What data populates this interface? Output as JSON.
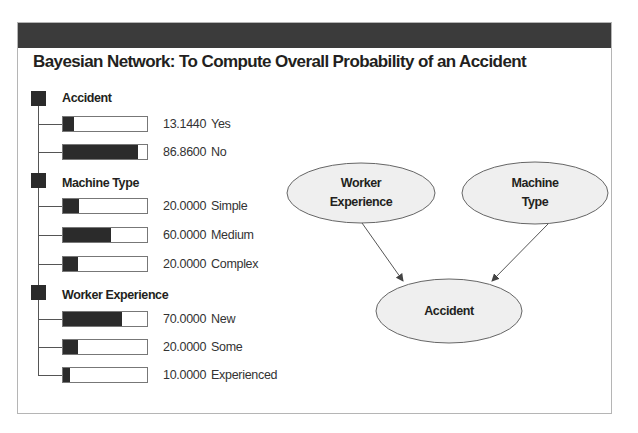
{
  "title": "Bayesian Network: To Compute Overall Probability of an Accident",
  "colors": {
    "header_bar": "#3b3b3b",
    "bar_fill": "#2b2b2b",
    "ellipse_fill": "#efefef"
  },
  "nodes": [
    {
      "name": "Accident",
      "states": [
        {
          "value": "13.1440",
          "label": "Yes",
          "percent": 13.144
        },
        {
          "value": "86.8600",
          "label": "No",
          "percent": 86.86
        }
      ]
    },
    {
      "name": "Machine Type",
      "states": [
        {
          "value": "20.0000",
          "label": "Simple",
          "percent": 20
        },
        {
          "value": "60.0000",
          "label": "Medium",
          "percent": 60
        },
        {
          "value": "20.0000",
          "label": "Complex",
          "percent": 20
        }
      ]
    },
    {
      "name": "Worker Experience",
      "states": [
        {
          "value": "70.0000",
          "label": "New",
          "percent": 70
        },
        {
          "value": "20.0000",
          "label": "Some",
          "percent": 20
        },
        {
          "value": "10.0000",
          "label": "Experienced",
          "percent": 10
        }
      ]
    }
  ],
  "network": {
    "ellipses": [
      {
        "id": "worker",
        "line1": "Worker",
        "line2": "Experience"
      },
      {
        "id": "machine",
        "line1": "Machine",
        "line2": "Type"
      },
      {
        "id": "accident",
        "line1": "Accident",
        "line2": ""
      }
    ],
    "edges": [
      {
        "from": "Worker Experience",
        "to": "Accident"
      },
      {
        "from": "Machine Type",
        "to": "Accident"
      }
    ]
  }
}
